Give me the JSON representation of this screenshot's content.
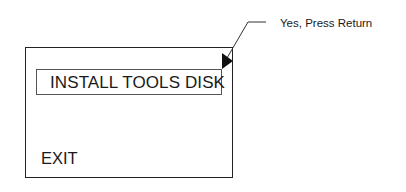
{
  "screen": {
    "menu_item": "INSTALL TOOLS DISK",
    "exit_label": "EXIT"
  },
  "callout": {
    "text": "Yes, Press Return",
    "pointer": "arrow-right-icon"
  },
  "colors": {
    "line": "#222222",
    "background": "#ffffff"
  }
}
